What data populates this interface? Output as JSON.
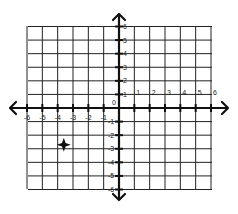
{
  "diagram": {
    "type": "coordinate-plane",
    "x_range": [
      -6,
      6
    ],
    "y_range": [
      -6,
      6
    ],
    "origin_label": "0",
    "x_tick_labels": [
      "-6",
      "-5",
      "-4",
      "-3",
      "-2",
      "-1",
      "1",
      "2",
      "3",
      "4",
      "5",
      "6"
    ],
    "y_tick_labels": [
      "6",
      "5",
      "4",
      "3",
      "2",
      "1",
      "-1",
      "-2",
      "-3",
      "-4",
      "-5",
      "-6"
    ],
    "grid": true,
    "arrows": [
      "left",
      "right",
      "up",
      "down"
    ],
    "colors": {
      "grid": "#222222",
      "axis": "#111111",
      "marker": "#111111",
      "background": "#ffffff"
    },
    "marker": {
      "shape": "four-point-star",
      "x": -3.6,
      "y": -2.7
    }
  }
}
